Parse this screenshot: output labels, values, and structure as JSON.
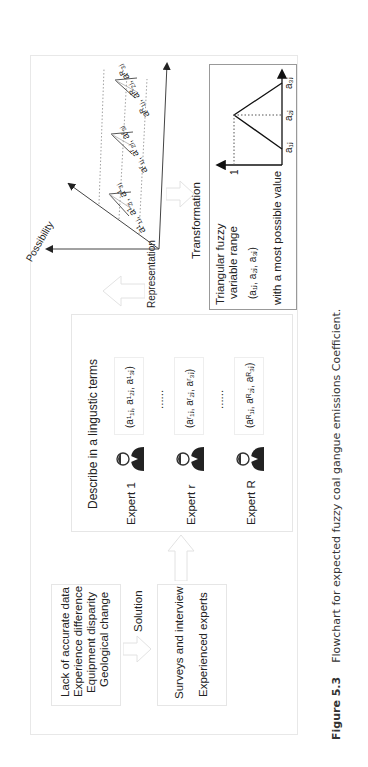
{
  "figure": {
    "number": "Figure 5.3",
    "caption": "Flowchart for expected fuzzy coal gangue emissions Coefficient."
  },
  "problems_box": {
    "lines": [
      "Lack of accurate data",
      "Experience difference",
      "Equipment disparity",
      "Geological change"
    ]
  },
  "solution_arrow": {
    "label": "Solution"
  },
  "solution_box": {
    "lines": [
      "Surveys and interview",
      "Experienced experts"
    ]
  },
  "experts_box": {
    "title": "Describe in a lingustic terms",
    "experts": [
      {
        "label": "Expert 1",
        "icon": "person-icon",
        "terms": "(a¹₁ⱼ, a¹₂ⱼ, a¹₃ⱼ)"
      },
      {
        "label": "Expert r",
        "icon": "person-icon",
        "terms": "(aʳ₁ⱼ, aʳ₂ⱼ, aʳ₃ⱼ)"
      },
      {
        "label": "Expert R",
        "icon": "person-icon",
        "terms": "(aᴿ₁ⱼ, aᴿ₂ⱼ, aᴿ₃ⱼ)"
      }
    ],
    "ellipsis": "......"
  },
  "representation_arrow": {
    "label": "Representation"
  },
  "possibility_chart": {
    "axis_label": "Possibility",
    "triangle_labels": [
      "a¹₁ⱼ, a¹₂ⱼ, a¹₃ⱼ",
      "aʳ₁ⱼ, aʳ₂ⱼ, aʳ₃ⱼ",
      "aᴿ₁ⱼ, aᴿ₂ⱼ, aᴿ₃ⱼ"
    ]
  },
  "transformation_arrow": {
    "label": "Transformation"
  },
  "tfn_box": {
    "title_line1": "Triangular fuzzy",
    "title_line2": "variable range",
    "tuple": "(a₁ⱼ, a₂ⱼ, a₃ⱼ)",
    "note": "with a most possible value",
    "y_tick": "1",
    "x_ticks": [
      "a₁ⱼ",
      "a₂ⱼ",
      "a₃ⱼ"
    ]
  }
}
